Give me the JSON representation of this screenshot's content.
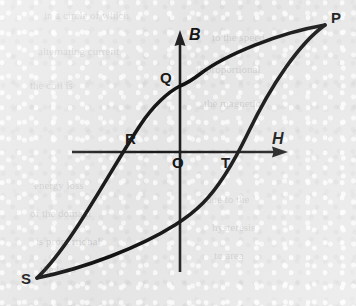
{
  "figure": {
    "kind": "hysteresis-loop-diagram",
    "background_color": "#e9e9e9",
    "ink_color": "#111111"
  },
  "axes": {
    "vertical": {
      "label": "B",
      "label_x": 189,
      "label_y": 27,
      "x": 180,
      "y_top": 30,
      "y_bottom": 272,
      "arrow": "up"
    },
    "horizontal": {
      "label": "H",
      "label_x": 272,
      "label_y": 131,
      "y": 152,
      "x_left": 72,
      "x_right": 288,
      "arrow": "right"
    }
  },
  "points": [
    {
      "id": "P",
      "label": "P",
      "x": 325,
      "y": 25,
      "label_x": 331,
      "label_y": 10,
      "role": "positive-saturation"
    },
    {
      "id": "Q",
      "label": "Q",
      "x": 180,
      "y": 85,
      "label_x": 160,
      "label_y": 70,
      "role": "remanence-positive"
    },
    {
      "id": "R",
      "label": "R",
      "x": 143,
      "y": 152,
      "label_x": 125,
      "label_y": 131,
      "role": "coercivity-negative"
    },
    {
      "id": "O",
      "label": "O",
      "x": 180,
      "y": 152,
      "label_x": 172,
      "label_y": 155,
      "role": "origin"
    },
    {
      "id": "T",
      "label": "T",
      "x": 222,
      "y": 152,
      "label_x": 221,
      "label_y": 155,
      "role": "coercivity-positive"
    },
    {
      "id": "S",
      "label": "S",
      "x": 37,
      "y": 278,
      "label_x": 21,
      "label_y": 271,
      "role": "negative-saturation"
    }
  ],
  "curve": {
    "stroke_width": 3.6,
    "upper_branch_path": "M 325 25 C 278 33, 225 55, 200 74 C 191 81, 185 84, 180 86 C 168 92, 153 106, 141 124 C 112 167, 72 245, 37 278",
    "lower_branch_path": "M 37 278 C 86 268, 140 247, 175 225 C 183 220, 193 213, 203 203 C 219 187, 232 166, 248 133 C 272 83, 300 43, 325 25"
  },
  "ghost_text": {
    "lines": [
      {
        "text": "in a circle of which",
        "x": 44,
        "y": 8
      },
      {
        "text": "to the speed",
        "x": 212,
        "y": 30
      },
      {
        "text": "alternating  current",
        "x": 38,
        "y": 44
      },
      {
        "text": "is   proportional",
        "x": 196,
        "y": 62
      },
      {
        "text": "the  coil  is",
        "x": 30,
        "y": 78
      },
      {
        "text": "the  magnetic",
        "x": 204,
        "y": 96
      },
      {
        "text": "energy  loss",
        "x": 34,
        "y": 178
      },
      {
        "text": "due  to  the",
        "x": 206,
        "y": 192
      },
      {
        "text": "of  the  domain",
        "x": 30,
        "y": 206
      },
      {
        "text": "hysteresis",
        "x": 212,
        "y": 220
      },
      {
        "text": "is  proportional",
        "x": 36,
        "y": 234
      },
      {
        "text": "to  area",
        "x": 214,
        "y": 248
      },
      {
        "text": "the  loop",
        "x": 40,
        "y": 262
      }
    ]
  }
}
